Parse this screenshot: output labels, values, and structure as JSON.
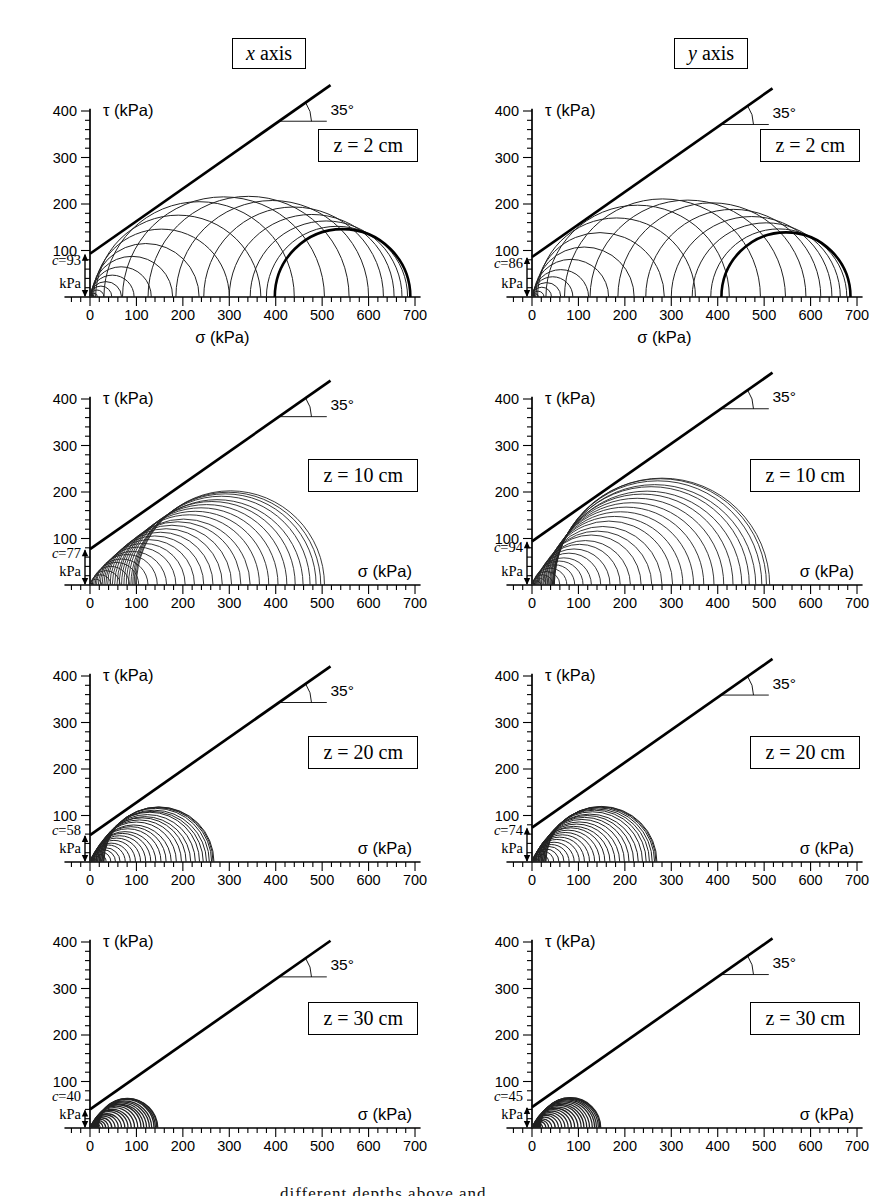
{
  "caption": {
    "fragment": "different depths above and"
  },
  "chart_data": {
    "type": "line",
    "subtype": "mohr-circle-diagrams",
    "grid": false,
    "columns": [
      {
        "label": "x axis",
        "variable": "x",
        "rest": " axis"
      },
      {
        "label": "y axis",
        "variable": "y",
        "rest": " axis"
      }
    ],
    "axes": {
      "xlabel": "σ (kPa)",
      "ylabel": "τ (kPa)",
      "x_range": [
        -55,
        712
      ],
      "y_range": [
        0,
        405
      ],
      "x_tick_labels": [
        "0",
        "100",
        "200",
        "300",
        "400",
        "500",
        "600",
        "700"
      ],
      "y_tick_labels": [
        "100",
        "200",
        "300",
        "400"
      ],
      "minor_tick_step": 20,
      "major_tick_step": 100
    },
    "panels": [
      {
        "id": "x-z2",
        "column": "x axis",
        "depth_label": "z = 2 cm",
        "cohesion_value": 93,
        "cohesion_label": "c=93",
        "cohesion_unit": "kPa",
        "angle_label": "35°",
        "xlabel": "σ (kPa)",
        "ylabel": "τ (kPa)",
        "xlabel_position": "bottom-center",
        "envelope": {
          "cohesion": 93,
          "angle_deg": 35
        },
        "solid_core": 1,
        "thick_last": true,
        "stroke_w": 1.0,
        "circles": [
          [
            0,
            9
          ],
          [
            0,
            16
          ],
          [
            0,
            30
          ],
          [
            0,
            47
          ],
          [
            0,
            68
          ],
          [
            1,
            95
          ],
          [
            2,
            132
          ],
          [
            3,
            178
          ],
          [
            5,
            235
          ],
          [
            8,
            300
          ],
          [
            12,
            368
          ],
          [
            30,
            440
          ],
          [
            70,
            505
          ],
          [
            125,
            558
          ],
          [
            185,
            600
          ],
          [
            245,
            632
          ],
          [
            300,
            655
          ],
          [
            345,
            672
          ],
          [
            380,
            684
          ],
          [
            398,
            690
          ]
        ]
      },
      {
        "id": "y-z2",
        "column": "y axis",
        "depth_label": "z = 2 cm",
        "cohesion_value": 86,
        "cohesion_label": "c=86",
        "cohesion_unit": "kPa",
        "angle_label": "35°",
        "xlabel": "σ (kPa)",
        "ylabel": "τ (kPa)",
        "xlabel_position": "bottom-center",
        "envelope": {
          "cohesion": 86,
          "angle_deg": 35
        },
        "solid_core": 1,
        "thick_last": true,
        "stroke_w": 1.0,
        "circles": [
          [
            0,
            8
          ],
          [
            0,
            14
          ],
          [
            0,
            26
          ],
          [
            0,
            42
          ],
          [
            0,
            62
          ],
          [
            1,
            88
          ],
          [
            2,
            122
          ],
          [
            3,
            165
          ],
          [
            5,
            220
          ],
          [
            8,
            285
          ],
          [
            12,
            352
          ],
          [
            30,
            425
          ],
          [
            70,
            492
          ],
          [
            125,
            546
          ],
          [
            185,
            590
          ],
          [
            245,
            622
          ],
          [
            300,
            646
          ],
          [
            345,
            664
          ],
          [
            385,
            678
          ],
          [
            408,
            686
          ]
        ]
      },
      {
        "id": "x-z10",
        "column": "x axis",
        "depth_label": "z = 10 cm",
        "cohesion_value": 77,
        "cohesion_label": "c=77",
        "cohesion_unit": "kPa",
        "angle_label": "35°",
        "xlabel": "σ (kPa)",
        "ylabel": "τ (kPa)",
        "xlabel_position": "axis-right",
        "envelope": {
          "cohesion": 77,
          "angle_deg": 35
        },
        "solid_core": 1,
        "thick_last": false,
        "stroke_w": 0.9,
        "circles": [
          [
            0,
            8
          ],
          [
            0,
            25
          ],
          [
            1,
            45
          ],
          [
            3,
            65
          ],
          [
            5,
            85
          ],
          [
            8,
            105
          ],
          [
            11,
            125
          ],
          [
            14,
            145
          ],
          [
            18,
            165
          ],
          [
            22,
            185
          ],
          [
            26,
            205
          ],
          [
            30,
            225
          ],
          [
            34,
            245
          ],
          [
            38,
            265
          ],
          [
            43,
            285
          ],
          [
            48,
            305
          ],
          [
            53,
            325
          ],
          [
            58,
            345
          ],
          [
            63,
            365
          ],
          [
            68,
            385
          ],
          [
            73,
            405
          ],
          [
            78,
            424
          ],
          [
            83,
            442
          ],
          [
            88,
            459
          ],
          [
            92,
            474
          ],
          [
            95,
            487
          ],
          [
            98,
            497
          ],
          [
            100,
            505
          ]
        ]
      },
      {
        "id": "y-z10",
        "column": "y axis",
        "depth_label": "z = 10 cm",
        "cohesion_value": 94,
        "cohesion_label": "c=94",
        "cohesion_unit": "kPa",
        "angle_label": "35°",
        "xlabel": "σ (kPa)",
        "ylabel": "τ (kPa)",
        "xlabel_position": "axis-right",
        "envelope": {
          "cohesion": 94,
          "angle_deg": 35
        },
        "solid_core": 1,
        "thick_last": false,
        "stroke_w": 0.9,
        "circles": [
          [
            0,
            8
          ],
          [
            0,
            18
          ],
          [
            0,
            30
          ],
          [
            1,
            45
          ],
          [
            2,
            60
          ],
          [
            3,
            75
          ],
          [
            5,
            92
          ],
          [
            7,
            110
          ],
          [
            9,
            128
          ],
          [
            11,
            148
          ],
          [
            13,
            168
          ],
          [
            15,
            190
          ],
          [
            18,
            212
          ],
          [
            20,
            235
          ],
          [
            23,
            258
          ],
          [
            25,
            280
          ],
          [
            28,
            303
          ],
          [
            30,
            325
          ],
          [
            33,
            348
          ],
          [
            35,
            370
          ],
          [
            38,
            392
          ],
          [
            40,
            413
          ],
          [
            42,
            433
          ],
          [
            44,
            452
          ],
          [
            45,
            468
          ],
          [
            46,
            482
          ],
          [
            47,
            495
          ],
          [
            48,
            505
          ],
          [
            48,
            512
          ]
        ]
      },
      {
        "id": "x-z20",
        "column": "x axis",
        "depth_label": "z = 20 cm",
        "cohesion_value": 58,
        "cohesion_label": "c=58",
        "cohesion_unit": "kPa",
        "angle_label": "35°",
        "xlabel": "σ (kPa)",
        "ylabel": "τ (kPa)",
        "xlabel_position": "axis-right",
        "envelope": {
          "cohesion": 58,
          "angle_deg": 35
        },
        "solid_core": 1,
        "thick_last": false,
        "stroke_w": 1.0,
        "circles": [
          [
            0,
            6
          ],
          [
            0,
            15
          ],
          [
            0,
            25
          ],
          [
            1,
            35
          ],
          [
            1,
            45
          ],
          [
            2,
            55
          ],
          [
            2,
            65
          ],
          [
            3,
            76
          ],
          [
            4,
            87
          ],
          [
            5,
            98
          ],
          [
            6,
            109
          ],
          [
            7,
            120
          ],
          [
            8,
            131
          ],
          [
            9,
            142
          ],
          [
            10,
            153
          ],
          [
            12,
            164
          ],
          [
            13,
            175
          ],
          [
            14,
            186
          ],
          [
            16,
            197
          ],
          [
            17,
            207
          ],
          [
            19,
            217
          ],
          [
            20,
            227
          ],
          [
            22,
            236
          ],
          [
            23,
            244
          ],
          [
            25,
            251
          ],
          [
            26,
            257
          ],
          [
            28,
            262
          ],
          [
            29,
            265
          ],
          [
            30,
            267
          ]
        ]
      },
      {
        "id": "y-z20",
        "column": "y axis",
        "depth_label": "z = 20 cm",
        "cohesion_value": 74,
        "cohesion_label": "c=74",
        "cohesion_unit": "kPa",
        "angle_label": "35°",
        "xlabel": "σ (kPa)",
        "ylabel": "τ (kPa)",
        "xlabel_position": "axis-right",
        "envelope": {
          "cohesion": 74,
          "angle_deg": 35
        },
        "solid_core": 1,
        "thick_last": false,
        "stroke_w": 1.0,
        "circles": [
          [
            0,
            6
          ],
          [
            0,
            15
          ],
          [
            0,
            25
          ],
          [
            1,
            36
          ],
          [
            1,
            47
          ],
          [
            2,
            58
          ],
          [
            2,
            69
          ],
          [
            3,
            80
          ],
          [
            4,
            91
          ],
          [
            5,
            102
          ],
          [
            6,
            113
          ],
          [
            7,
            124
          ],
          [
            8,
            135
          ],
          [
            9,
            146
          ],
          [
            10,
            157
          ],
          [
            12,
            168
          ],
          [
            13,
            179
          ],
          [
            14,
            189
          ],
          [
            16,
            199
          ],
          [
            17,
            209
          ],
          [
            19,
            219
          ],
          [
            20,
            229
          ],
          [
            22,
            238
          ],
          [
            23,
            246
          ],
          [
            25,
            253
          ],
          [
            26,
            259
          ],
          [
            28,
            264
          ],
          [
            29,
            267
          ],
          [
            30,
            269
          ]
        ]
      },
      {
        "id": "x-z30",
        "column": "x axis",
        "depth_label": "z = 30 cm",
        "cohesion_value": 40,
        "cohesion_label": "c=40",
        "cohesion_unit": "kPa",
        "angle_label": "35°",
        "xlabel": "σ (kPa)",
        "ylabel": "τ (kPa)",
        "xlabel_position": "axis-right",
        "envelope": {
          "cohesion": 40,
          "angle_deg": 35
        },
        "solid_core": 1,
        "thick_last": false,
        "stroke_w": 1.3,
        "circles": [
          [
            0,
            5
          ],
          [
            0,
            10
          ],
          [
            0,
            16
          ],
          [
            1,
            22
          ],
          [
            1,
            28
          ],
          [
            2,
            34
          ],
          [
            2,
            40
          ],
          [
            3,
            47
          ],
          [
            3,
            54
          ],
          [
            4,
            61
          ],
          [
            5,
            68
          ],
          [
            5,
            75
          ],
          [
            6,
            82
          ],
          [
            7,
            89
          ],
          [
            8,
            96
          ],
          [
            9,
            103
          ],
          [
            10,
            110
          ],
          [
            11,
            116
          ],
          [
            12,
            122
          ],
          [
            13,
            128
          ],
          [
            14,
            133
          ],
          [
            15,
            138
          ],
          [
            16,
            141
          ],
          [
            17,
            144
          ],
          [
            18,
            146
          ]
        ]
      },
      {
        "id": "y-z30",
        "column": "y axis",
        "depth_label": "z = 30 cm",
        "cohesion_value": 45,
        "cohesion_label": "c=45",
        "cohesion_unit": "kPa",
        "angle_label": "35°",
        "xlabel": "σ (kPa)",
        "ylabel": "τ (kPa)",
        "xlabel_position": "axis-right",
        "envelope": {
          "cohesion": 45,
          "angle_deg": 35
        },
        "solid_core": 1,
        "thick_last": false,
        "stroke_w": 1.3,
        "circles": [
          [
            0,
            5
          ],
          [
            0,
            10
          ],
          [
            0,
            17
          ],
          [
            1,
            23
          ],
          [
            1,
            30
          ],
          [
            2,
            36
          ],
          [
            2,
            43
          ],
          [
            3,
            50
          ],
          [
            3,
            57
          ],
          [
            4,
            64
          ],
          [
            5,
            71
          ],
          [
            5,
            78
          ],
          [
            6,
            85
          ],
          [
            7,
            92
          ],
          [
            8,
            99
          ],
          [
            9,
            106
          ],
          [
            10,
            112
          ],
          [
            11,
            118
          ],
          [
            12,
            124
          ],
          [
            13,
            130
          ],
          [
            14,
            135
          ],
          [
            15,
            139
          ],
          [
            16,
            143
          ],
          [
            17,
            146
          ],
          [
            18,
            148
          ]
        ]
      }
    ]
  }
}
